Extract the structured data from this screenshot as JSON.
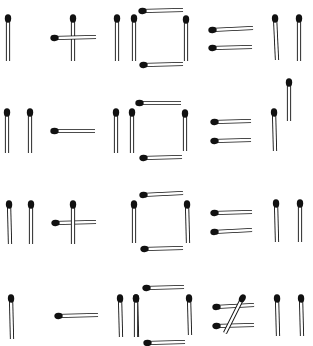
{
  "colors": {
    "background": "#ffffff",
    "stick_fill": "#ffffff",
    "stick_outline": "#111111",
    "head": "#111111"
  },
  "rows": [
    {
      "equation": "I + I|□ = II",
      "matches": [
        {
          "x1": 8,
          "y1": 17,
          "x2": 8,
          "y2": 61
        },
        {
          "x1": 73,
          "y1": 17,
          "x2": 73,
          "y2": 61
        },
        {
          "x1": 53,
          "y1": 38,
          "x2": 96,
          "y2": 37
        },
        {
          "x1": 117,
          "y1": 17,
          "x2": 117,
          "y2": 61
        },
        {
          "x1": 134,
          "y1": 17,
          "x2": 134,
          "y2": 61
        },
        {
          "x1": 141,
          "y1": 11,
          "x2": 183,
          "y2": 10
        },
        {
          "x1": 186,
          "y1": 18,
          "x2": 186,
          "y2": 61
        },
        {
          "x1": 142,
          "y1": 65,
          "x2": 183,
          "y2": 64
        },
        {
          "x1": 211,
          "y1": 30,
          "x2": 253,
          "y2": 28
        },
        {
          "x1": 211,
          "y1": 48,
          "x2": 252,
          "y2": 47
        },
        {
          "x1": 275,
          "y1": 17,
          "x2": 277,
          "y2": 60
        },
        {
          "x1": 299,
          "y1": 17,
          "x2": 299,
          "y2": 61
        }
      ]
    },
    {
      "equation": "II − I|□ = raised stick",
      "matches": [
        {
          "x1": 7,
          "y1": 111,
          "x2": 7,
          "y2": 153
        },
        {
          "x1": 30,
          "y1": 111,
          "x2": 30,
          "y2": 153
        },
        {
          "x1": 53,
          "y1": 131,
          "x2": 95,
          "y2": 131
        },
        {
          "x1": 116,
          "y1": 111,
          "x2": 116,
          "y2": 153
        },
        {
          "x1": 132,
          "y1": 111,
          "x2": 132,
          "y2": 153
        },
        {
          "x1": 138,
          "y1": 103,
          "x2": 181,
          "y2": 103
        },
        {
          "x1": 185,
          "y1": 112,
          "x2": 185,
          "y2": 151
        },
        {
          "x1": 142,
          "y1": 158,
          "x2": 182,
          "y2": 157
        },
        {
          "x1": 213,
          "y1": 122,
          "x2": 251,
          "y2": 121
        },
        {
          "x1": 213,
          "y1": 141,
          "x2": 251,
          "y2": 140
        },
        {
          "x1": 274,
          "y1": 111,
          "x2": 275,
          "y2": 151
        },
        {
          "x1": 289,
          "y1": 81,
          "x2": 289,
          "y2": 121
        }
      ]
    },
    {
      "equation": "II + □ = II",
      "matches": [
        {
          "x1": 9,
          "y1": 203,
          "x2": 10,
          "y2": 244
        },
        {
          "x1": 31,
          "y1": 203,
          "x2": 31,
          "y2": 244
        },
        {
          "x1": 54,
          "y1": 223,
          "x2": 96,
          "y2": 222
        },
        {
          "x1": 73,
          "y1": 203,
          "x2": 73,
          "y2": 244
        },
        {
          "x1": 134,
          "y1": 203,
          "x2": 134,
          "y2": 243
        },
        {
          "x1": 142,
          "y1": 195,
          "x2": 183,
          "y2": 193
        },
        {
          "x1": 187,
          "y1": 203,
          "x2": 188,
          "y2": 243
        },
        {
          "x1": 143,
          "y1": 249,
          "x2": 183,
          "y2": 248
        },
        {
          "x1": 213,
          "y1": 213,
          "x2": 252,
          "y2": 212
        },
        {
          "x1": 213,
          "y1": 232,
          "x2": 252,
          "y2": 230
        },
        {
          "x1": 276,
          "y1": 202,
          "x2": 277,
          "y2": 242
        },
        {
          "x1": 300,
          "y1": 202,
          "x2": 300,
          "y2": 242
        }
      ]
    },
    {
      "equation": "I − II□ ≠ II",
      "matches": [
        {
          "x1": 11,
          "y1": 297,
          "x2": 12,
          "y2": 339
        },
        {
          "x1": 57,
          "y1": 316,
          "x2": 98,
          "y2": 315
        },
        {
          "x1": 120,
          "y1": 297,
          "x2": 121,
          "y2": 337
        },
        {
          "x1": 136,
          "y1": 297,
          "x2": 137,
          "y2": 337
        },
        {
          "x1": 145,
          "y1": 288,
          "x2": 184,
          "y2": 287
        },
        {
          "x1": 136,
          "y1": 297,
          "x2": 136,
          "y2": 337
        },
        {
          "x1": 189,
          "y1": 297,
          "x2": 190,
          "y2": 335
        },
        {
          "x1": 146,
          "y1": 343,
          "x2": 185,
          "y2": 342
        },
        {
          "x1": 215,
          "y1": 307,
          "x2": 254,
          "y2": 305
        },
        {
          "x1": 215,
          "y1": 326,
          "x2": 254,
          "y2": 325
        },
        {
          "x1": 243,
          "y1": 297,
          "x2": 225,
          "y2": 333
        },
        {
          "x1": 277,
          "y1": 297,
          "x2": 278,
          "y2": 336
        },
        {
          "x1": 301,
          "y1": 297,
          "x2": 302,
          "y2": 336
        }
      ]
    }
  ]
}
